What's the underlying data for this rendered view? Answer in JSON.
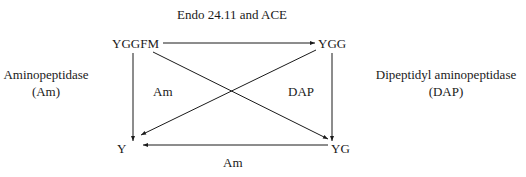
{
  "title": "Endo 24.11 and ACE",
  "nodes": {
    "top_left": "YGGFM",
    "top_right": "YGG",
    "bottom_left": "Y",
    "bottom_right": "YG"
  },
  "edge_labels": {
    "inner_left": "Am",
    "inner_right": "DAP",
    "bottom": "Am"
  },
  "side_labels": {
    "left": {
      "line1": "Aminopeptidase",
      "line2": "(Am)"
    },
    "right": {
      "line1": "Dipeptidyl aminopeptidase",
      "line2": "(DAP)"
    }
  },
  "edges": [
    {
      "from": "YGGFM",
      "to": "YGG",
      "label": "Endo 24.11 and ACE"
    },
    {
      "from": "YGGFM",
      "to": "Y",
      "label": "Am"
    },
    {
      "from": "YGGFM",
      "to": "YG",
      "label": "DAP"
    },
    {
      "from": "YGG",
      "to": "Y",
      "label": "Am"
    },
    {
      "from": "YGG",
      "to": "YG",
      "label": "DAP"
    },
    {
      "from": "YG",
      "to": "Y",
      "label": "Am"
    }
  ],
  "colors": {
    "line": "#1a1a1a",
    "background": "#ffffff"
  }
}
